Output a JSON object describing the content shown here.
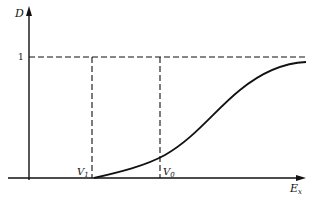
{
  "diagram": {
    "y_axis_label": "D",
    "x_axis_label": "E",
    "x_axis_subscript": "x",
    "level_label": "1",
    "markers": [
      {
        "label": "V",
        "subscript": "1"
      },
      {
        "label": "V",
        "subscript": "0"
      }
    ]
  }
}
